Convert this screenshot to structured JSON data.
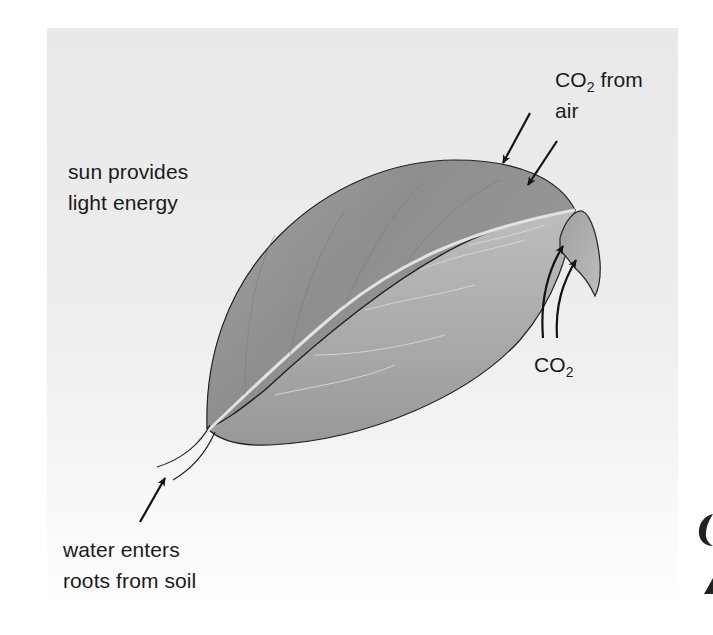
{
  "diagram": {
    "labels": {
      "sun": {
        "line1": "sun provides",
        "line2": "light energy"
      },
      "co2_air": {
        "prefix": "CO",
        "subscript": "2",
        "suffix": " from",
        "line2": "air"
      },
      "co2_underside": {
        "prefix": "CO",
        "subscript": "2"
      },
      "water": {
        "line1": "water enters",
        "line2": "roots from soil"
      }
    },
    "arrows": [
      {
        "name": "co2-air-arrow-1",
        "direction": "down-left",
        "target": "upper leaf surface"
      },
      {
        "name": "co2-air-arrow-2",
        "direction": "down-left",
        "target": "upper leaf surface"
      },
      {
        "name": "co2-underside-arrow-1",
        "direction": "up",
        "target": "leaf underside"
      },
      {
        "name": "co2-underside-arrow-2",
        "direction": "up",
        "target": "leaf underside"
      },
      {
        "name": "water-arrow",
        "direction": "up-right",
        "target": "stem"
      }
    ],
    "colors": {
      "panel_top": "#e9e9e9",
      "leaf_upper_dark": "#8f8f8f",
      "leaf_upper_light": "#b5b5b5",
      "leaf_under": "#a9a9a9",
      "midrib": "#dcdcdc",
      "ink": "#111111"
    }
  }
}
